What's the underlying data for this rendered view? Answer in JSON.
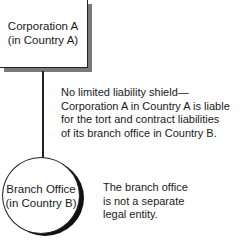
{
  "parent": {
    "line1": "Corporation A",
    "line2": "(in Country A)"
  },
  "branch": {
    "line1": "Branch Office",
    "line2": "(in Country B)"
  },
  "liability_note": {
    "lines": [
      "No limited liability shield—",
      "Corporation A in Country A is liable",
      "for the tort and contract liabilities",
      "of its branch office in Country B."
    ]
  },
  "branch_note": {
    "lines": [
      "The branch office",
      "is not a separate",
      "legal entity."
    ]
  },
  "colors": {
    "box_shadow": "#7a7a7a",
    "circle_shadow": "#111111",
    "stroke": "#222222"
  }
}
